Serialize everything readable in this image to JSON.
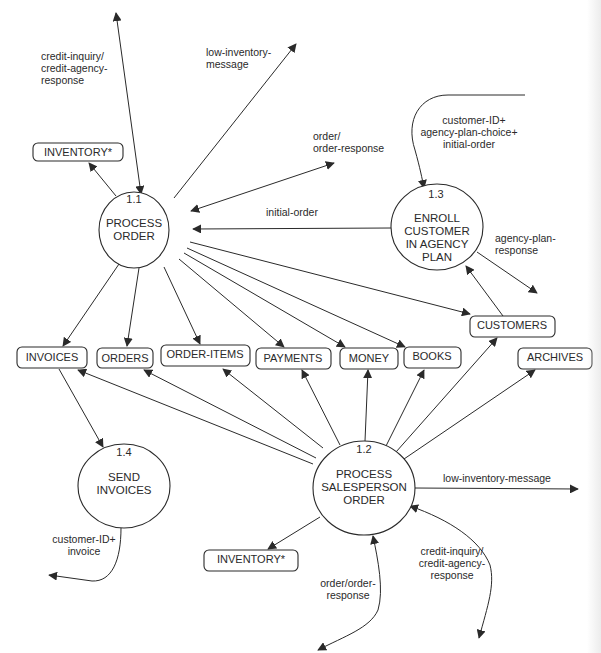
{
  "diagram": {
    "type": "data-flow-diagram",
    "processes": [
      {
        "id": "1.1",
        "number": "1.1",
        "lines": [
          "PROCESS",
          "ORDER"
        ]
      },
      {
        "id": "1.2",
        "number": "1.2",
        "lines": [
          "PROCESS",
          "SALESPERSON",
          "ORDER"
        ]
      },
      {
        "id": "1.3",
        "number": "1.3",
        "lines": [
          "ENROLL",
          "CUSTOMER",
          "IN AGENCY",
          "PLAN"
        ]
      },
      {
        "id": "1.4",
        "number": "1.4",
        "lines": [
          "SEND",
          "INVOICES"
        ]
      }
    ],
    "stores": {
      "inventory_top": "INVENTORY*",
      "inventory_bottom": "INVENTORY*",
      "invoices": "INVOICES",
      "orders": "ORDERS",
      "order_items": "ORDER-ITEMS",
      "payments": "PAYMENTS",
      "money": "MONEY",
      "books": "BOOKS",
      "customers": "CUSTOMERS",
      "archives": "ARCHIVES"
    },
    "flow_labels": {
      "credit_top": [
        "credit-inquiry/",
        "credit-agency-",
        "response"
      ],
      "low_inv_top": [
        "low-inventory-",
        "message"
      ],
      "order_top": [
        "order/",
        "order-response"
      ],
      "enroll_in": [
        "customer-ID+",
        "agency-plan-choice+",
        "initial-order"
      ],
      "initial_order": [
        "initial-order"
      ],
      "agency_resp": [
        "agency-plan-",
        "response"
      ],
      "low_inv_bottom": [
        "low-inventory-message"
      ],
      "invoice_out": [
        "customer-ID+",
        "invoice"
      ],
      "order_bottom": [
        "order/order-",
        "response"
      ],
      "credit_bottom": [
        "credit-inquiry/",
        "credit-agency-",
        "response"
      ]
    },
    "colors": {
      "ink": "#2a2a2a",
      "background": "#ffffff"
    }
  }
}
